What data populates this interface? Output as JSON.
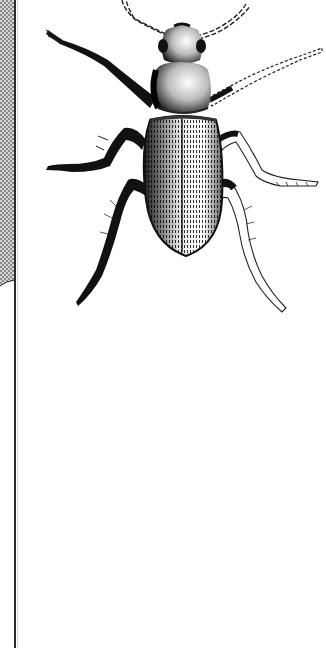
{
  "image": {
    "subject": "beetle",
    "style": "pen-and-ink stipple illustration",
    "colors": {
      "ink": "#111111",
      "paper": "#ffffff",
      "halftone_strip": "#9a9a9a",
      "rule": "#2a2a2a"
    }
  }
}
